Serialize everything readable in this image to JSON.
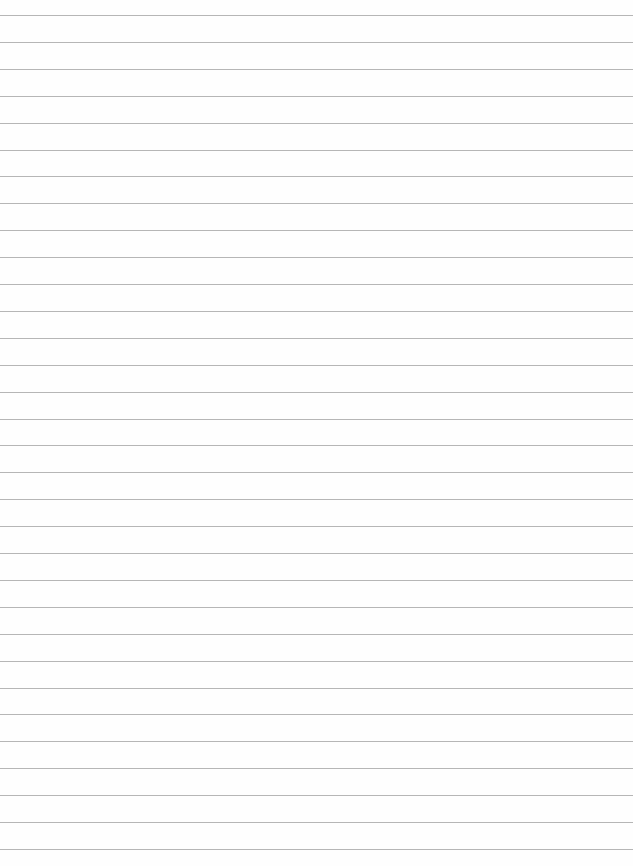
{
  "sheet": {
    "type": "lined-paper",
    "background_color": "#fefefe",
    "rule_color": "#a9a9a9",
    "first_rule_y": 15,
    "rule_spacing": 26.9,
    "rule_count": 32
  }
}
